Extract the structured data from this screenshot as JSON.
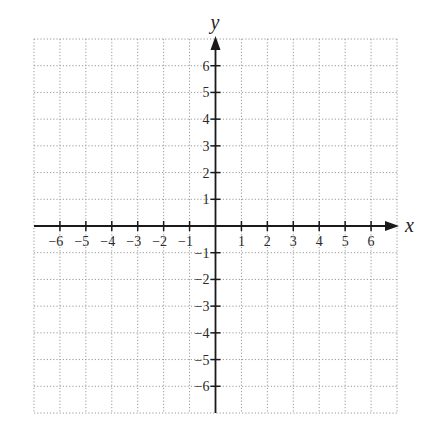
{
  "chart_data": {
    "type": "scatter",
    "title": "",
    "xlabel": "x",
    "ylabel": "y",
    "xlim": [
      -7,
      7
    ],
    "ylim": [
      -7,
      7
    ],
    "grid": true,
    "grid_style": "dotted",
    "x_ticks": [
      -6,
      -5,
      -4,
      -3,
      -2,
      -1,
      1,
      2,
      3,
      4,
      5,
      6
    ],
    "y_ticks": [
      -6,
      -5,
      -4,
      -3,
      -2,
      -1,
      1,
      2,
      3,
      4,
      5,
      6
    ],
    "x_tick_labels": [
      "−6",
      "−5",
      "−4",
      "−3",
      "−2",
      "−1",
      "1",
      "2",
      "3",
      "4",
      "5",
      "6"
    ],
    "y_tick_labels": [
      "−6",
      "−5",
      "−4",
      "−3",
      "−2",
      "−1",
      "1",
      "2",
      "3",
      "4",
      "5",
      "6"
    ],
    "series": [],
    "legend": null
  },
  "axes": {
    "x_name": "x",
    "y_name": "y"
  },
  "colors": {
    "axis": "#1a1a1a",
    "grid": "#9a9a9a",
    "text": "#2a2a2a"
  }
}
